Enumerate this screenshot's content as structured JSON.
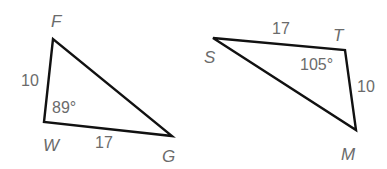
{
  "diagram": {
    "triangle1": {
      "vertices": [
        "F",
        "W",
        "G"
      ],
      "side_FW": "10",
      "side_WG": "17",
      "angle_W": "89°"
    },
    "triangle2": {
      "vertices": [
        "S",
        "T",
        "M"
      ],
      "side_ST": "17",
      "side_TM": "10",
      "angle_T": "105°"
    },
    "colors": {
      "stroke": "#111111",
      "label": "#6b6b6b",
      "background": "#ffffff"
    }
  }
}
